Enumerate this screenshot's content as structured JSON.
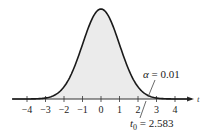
{
  "chart_data": {
    "type": "area",
    "title": "",
    "xlabel": "t",
    "ylabel": "",
    "distribution": "Student t density (bell curve), right-tailed test",
    "x_ticks": [
      -4,
      -3,
      -2,
      -1,
      0,
      1,
      2,
      3,
      4
    ],
    "x_tick_labels": [
      "−4",
      "−3",
      "−2",
      "−1",
      "0",
      "1",
      "2",
      "3",
      "4"
    ],
    "xlim": [
      -4.8,
      4.9
    ],
    "grid": false,
    "legend": null,
    "shaded_region": {
      "from": -4.8,
      "to": 4.9,
      "color": "#ebebeb"
    },
    "critical_value": 2.583,
    "alpha": 0.01,
    "annotations": [
      {
        "text": "α = 0.01",
        "points_to": "right tail area beyond t0"
      },
      {
        "text": "t₀ = 2.583",
        "points_to": "critical value on t axis"
      }
    ]
  },
  "labels": {
    "axis_name": "t",
    "alpha_symbol": "α",
    "alpha_rest": " = 0.01",
    "t0_base": "t",
    "t0_sub": "0",
    "t0_rest": " = 2.583"
  },
  "colors": {
    "curve": "#1a1a1a",
    "fill": "#ebebeb",
    "axis": "#333333"
  }
}
